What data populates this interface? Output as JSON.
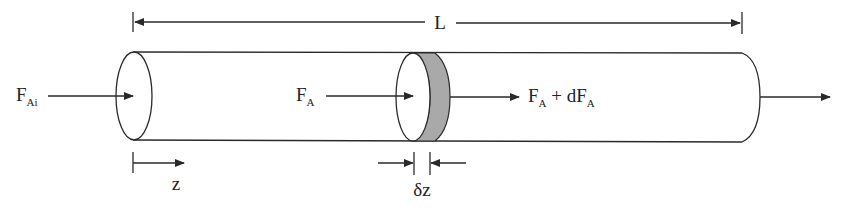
{
  "diagram": {
    "colors": {
      "stroke": "#2a2a2a",
      "shaded_element": "#a9a9a9",
      "background": "#ffffff"
    },
    "labels": {
      "length": "L",
      "inlet_flow_main": "F",
      "inlet_flow_sub": "Ai",
      "element_in_main": "F",
      "element_in_sub": "A",
      "element_out_main1": "F",
      "element_out_sub1": "A",
      "element_out_plus": " + dF",
      "element_out_sub2": "A",
      "axial_coordinate": "z",
      "element_thickness": "δz"
    },
    "components": [
      "reactor-tube",
      "inlet-face-ellipse",
      "differential-element-disk",
      "outlet-end-cap",
      "length-dimension-L",
      "z-axis-arrow",
      "delta-z-dimension"
    ]
  }
}
